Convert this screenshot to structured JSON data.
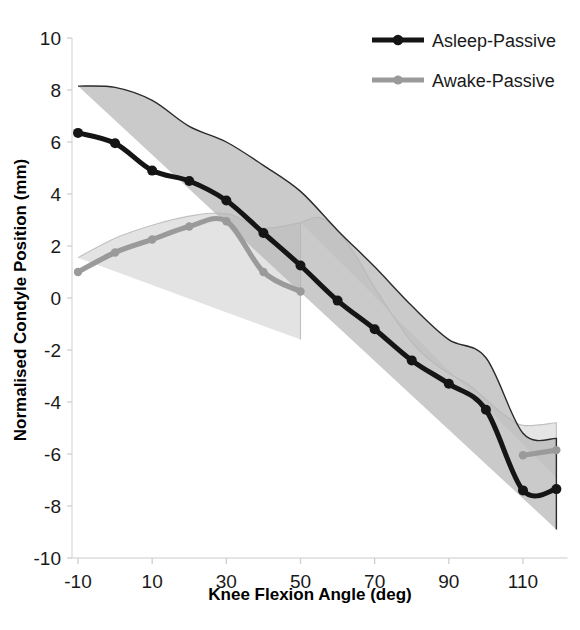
{
  "chart_data": {
    "type": "line",
    "title": "",
    "xlabel": "Knee Flexion Angle (deg)",
    "ylabel": "Normalised Condyle Position (mm)",
    "xlim": [
      -12,
      122
    ],
    "ylim": [
      -10,
      10
    ],
    "xticks": [
      -10,
      10,
      30,
      50,
      70,
      90,
      110
    ],
    "xtick_labels": [
      "-10",
      "10",
      "30",
      "50",
      "70",
      "90",
      "110"
    ],
    "yticks": [
      -10,
      -8,
      -6,
      -4,
      -2,
      0,
      2,
      4,
      6,
      8,
      10
    ],
    "ytick_labels": [
      "-10",
      "-8",
      "-6",
      "-4",
      "-2",
      "0",
      "2",
      "4",
      "6",
      "8",
      "10"
    ],
    "grid": false,
    "legend_position": "top-right",
    "series": [
      {
        "name": "Asleep-Passive",
        "color": "#151515",
        "band_fill": "#b5b5b5",
        "band_stroke": "#2a2a2a",
        "marker": "circle",
        "x": [
          -10,
          0,
          10,
          20,
          30,
          40,
          50,
          60,
          70,
          80,
          90,
          100,
          110,
          119
        ],
        "values": [
          6.35,
          5.95,
          4.9,
          4.5,
          3.75,
          2.5,
          1.25,
          -0.1,
          -1.2,
          -2.4,
          -3.3,
          -4.3,
          -7.4,
          -7.35
        ],
        "band_upper": [
          8.15,
          8.1,
          7.6,
          6.6,
          6.0,
          5.1,
          4.1,
          2.6,
          1.2,
          -0.3,
          -1.6,
          -2.3,
          -5.2,
          -5.4
        ],
        "band_lower": [
          3.4,
          4.15,
          3.5,
          3.2,
          3.1,
          2.0,
          0.2,
          -1.2,
          -2.5,
          -3.9,
          -4.9,
          -6.1,
          -9.0,
          -8.9
        ]
      },
      {
        "name": "Awake-Passive",
        "color": "#9a9a9a",
        "band_fill": "#dedede",
        "band_stroke": "#c0c0c0",
        "marker": "circle",
        "x": [
          -10,
          0,
          10,
          20,
          30,
          40,
          50
        ],
        "values": [
          1.0,
          1.75,
          2.25,
          2.75,
          2.95,
          1.0,
          0.25
        ],
        "band_upper": [
          1.55,
          2.3,
          2.8,
          3.15,
          3.25,
          2.7,
          2.9
        ],
        "band_lower": [
          -0.3,
          0.55,
          1.45,
          2.1,
          2.05,
          0.0,
          -1.6
        ],
        "x2": [
          110,
          119
        ],
        "values2": [
          -6.05,
          -5.85
        ],
        "band_upper2": [
          -4.9,
          -4.8
        ],
        "band_lower2": [
          -7.1,
          -6.9
        ]
      }
    ],
    "awake_band_tail": {
      "x": [
        50,
        55,
        60,
        65,
        70,
        75,
        80,
        85,
        90,
        95,
        100,
        105,
        110,
        119
      ],
      "upper": [
        2.9,
        3.1,
        2.6,
        1.6,
        0.4,
        -0.7,
        -1.7,
        -2.4,
        -2.9,
        -3.3,
        -3.9,
        -4.5,
        -4.9,
        -4.8
      ],
      "lower": [
        -1.6,
        -2.5,
        -3.2,
        -3.7,
        -4.1,
        -4.5,
        -4.9,
        -5.3,
        -5.6,
        -6.0,
        -6.4,
        -6.8,
        -7.1,
        -6.9
      ]
    }
  },
  "legend": {
    "items": [
      {
        "label": "Asleep-Passive",
        "color": "#151515"
      },
      {
        "label": "Awake-Passive",
        "color": "#9a9a9a"
      }
    ]
  },
  "axes": {
    "x_title": "Knee Flexion Angle (deg)",
    "y_title": "Normalised Condyle Position (mm)"
  }
}
